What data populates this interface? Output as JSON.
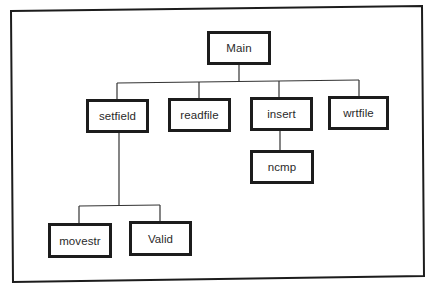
{
  "diagram": {
    "type": "hierarchy-chart",
    "colors": {
      "background": "#ffffff",
      "stroke": "#1c1c1c",
      "text": "#2a2a2a"
    },
    "nodes": [
      {
        "id": "main",
        "label": "Main",
        "parent": null
      },
      {
        "id": "setfield",
        "label": "setfield",
        "parent": "main"
      },
      {
        "id": "readfile",
        "label": "readfile",
        "parent": "main"
      },
      {
        "id": "insert",
        "label": "insert",
        "parent": "main"
      },
      {
        "id": "wrtfile",
        "label": "wrtfile",
        "parent": "main"
      },
      {
        "id": "ncmp",
        "label": "ncmp",
        "parent": "insert"
      },
      {
        "id": "movestr",
        "label": "movestr",
        "parent": "setfield"
      },
      {
        "id": "valid",
        "label": "Valid",
        "parent": "setfield"
      }
    ]
  }
}
